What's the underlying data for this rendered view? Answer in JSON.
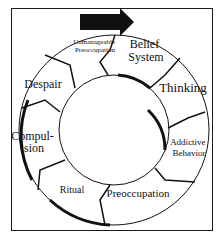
{
  "diagram": {
    "type": "cycle",
    "arrow_label": "",
    "stages": [
      {
        "id": "unmanageable-preoccupation",
        "lines": [
          "Unmanageable",
          "Preoccupation"
        ]
      },
      {
        "id": "belief-system",
        "lines": [
          "Belief",
          "System"
        ]
      },
      {
        "id": "thinking",
        "lines": [
          "Thinking"
        ]
      },
      {
        "id": "addictive-behavior",
        "lines": [
          "Addictive",
          "Behavior"
        ]
      },
      {
        "id": "preoccupation",
        "lines": [
          "Preoccupation"
        ]
      },
      {
        "id": "ritual",
        "lines": [
          "Ritual"
        ]
      },
      {
        "id": "compulsion",
        "lines": [
          "Compul-",
          "sion"
        ]
      },
      {
        "id": "despair",
        "lines": [
          "Despair"
        ]
      }
    ],
    "colors": {
      "ink": "#111111",
      "background": "#ffffff",
      "arrow": "#111111"
    }
  }
}
